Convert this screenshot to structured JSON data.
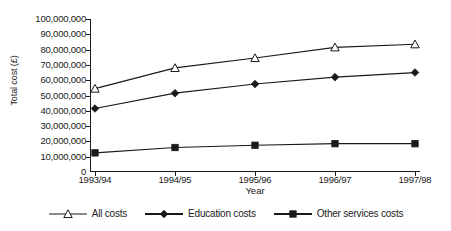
{
  "chart_data": {
    "type": "line",
    "title": "",
    "xlabel": "Year",
    "ylabel": "Total cost (£)",
    "categories": [
      "1993/94",
      "1994/95",
      "1995/96",
      "1996/97",
      "1997/98"
    ],
    "ylim": [
      0,
      100000000
    ],
    "ytick_step": 10000000,
    "ytick_labels": [
      "100,000,000",
      "90,000,000",
      "80,000,000",
      "70,000,000",
      "60,000,000",
      "50,000,000",
      "40,000,000",
      "30,000,000",
      "20,000,000",
      "10,000,000",
      "0"
    ],
    "ytick_values": [
      100000000,
      90000000,
      80000000,
      70000000,
      60000000,
      50000000,
      40000000,
      30000000,
      20000000,
      10000000,
      0
    ],
    "grid": false,
    "legend_position": "bottom",
    "series": [
      {
        "name": "All costs",
        "marker": "open-triangle",
        "color": "#1a1a1a",
        "values": [
          54500000,
          68000000,
          74500000,
          81500000,
          83500000
        ]
      },
      {
        "name": "Education costs",
        "marker": "filled-diamond",
        "color": "#1a1a1a",
        "values": [
          41500000,
          51500000,
          57500000,
          62000000,
          65000000
        ]
      },
      {
        "name": "Other services costs",
        "marker": "filled-square",
        "color": "#1a1a1a",
        "values": [
          12500000,
          16000000,
          17500000,
          18500000,
          18500000
        ]
      }
    ]
  },
  "legend": {
    "items": [
      {
        "label": "All costs",
        "marker": "open-triangle"
      },
      {
        "label": "Education costs",
        "marker": "filled-diamond"
      },
      {
        "label": "Other services costs",
        "marker": "filled-square"
      }
    ]
  }
}
